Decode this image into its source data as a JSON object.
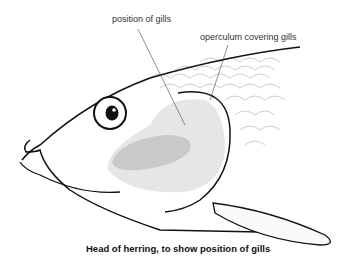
{
  "labels": {
    "gills": "position of gills",
    "operculum": "operculum covering gills"
  },
  "caption": "Head of herring, to show position of gills",
  "colors": {
    "outline": "#111111",
    "gill_shade_light": "#e4e4e4",
    "gill_shade_dark": "#c8c8c8",
    "scale_lines": "#888888"
  }
}
